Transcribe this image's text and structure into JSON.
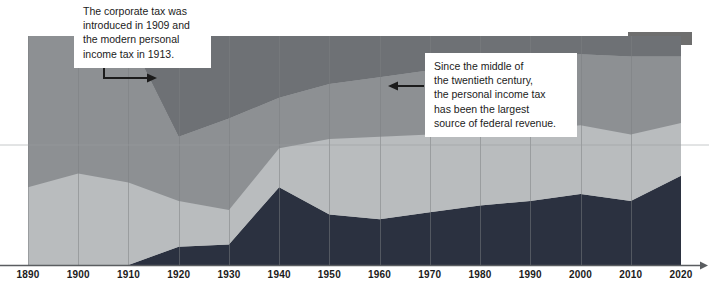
{
  "chart_data": {
    "type": "area",
    "title": "",
    "subtitle": "",
    "xlabel": "",
    "ylabel": "",
    "grid": true,
    "legend_position": "top-right",
    "xlim": [
      1890,
      2020
    ],
    "ylim": [
      0,
      100
    ],
    "x": [
      1890,
      1900,
      1910,
      1920,
      1930,
      1940,
      1950,
      1960,
      1970,
      1980,
      1990,
      2000,
      2010,
      2020
    ],
    "tick_labels": [
      "1890",
      "1900",
      "1910",
      "1920",
      "1930",
      "1940",
      "1950",
      "1960",
      "1970",
      "1980",
      "1990",
      "2000",
      "2010",
      "2020"
    ],
    "stacked": true,
    "series": [
      {
        "name": "personal-income-tax",
        "color": "#2b3140",
        "values": [
          0,
          0,
          0,
          8,
          9,
          34,
          22,
          20,
          23,
          26,
          28,
          31,
          28,
          39
        ]
      },
      {
        "name": "other-revenue-lower",
        "color": "#b9bcbe",
        "values": [
          34,
          40,
          36,
          20,
          15,
          17,
          33,
          36,
          34,
          33,
          31,
          30,
          29,
          23
        ]
      },
      {
        "name": "excise-and-payroll",
        "color": "#8d9093",
        "values": [
          66,
          60,
          64,
          28,
          40,
          22,
          24,
          26,
          28,
          30,
          32,
          31,
          34,
          29
        ]
      },
      {
        "name": "customs-and-tariffs",
        "color": "#6e7175",
        "values": [
          0,
          0,
          0,
          44,
          36,
          27,
          21,
          18,
          15,
          11,
          9,
          8,
          9,
          9
        ]
      }
    ]
  },
  "legend": {
    "fragment_visible": true,
    "swatch_color": "#6e6e6e"
  },
  "annotations": [
    {
      "id": "callout-1",
      "lines": [
        "The corporate tax was",
        "introduced in 1909 and",
        "the modern personal",
        "income tax in 1913."
      ],
      "arrow": "elbow-right",
      "arrow_color": "#1b1b1b"
    },
    {
      "id": "callout-2",
      "lines": [
        "Since the middle of",
        "the twentieth century,",
        "the personal income tax",
        "has been the largest",
        "source of federal revenue."
      ],
      "arrow": "left",
      "arrow_color": "#1b1b1b"
    }
  ],
  "axis": {
    "baseline_color": "#5a5d60",
    "arrowhead": true,
    "gridline_color": "#7c7f82"
  }
}
